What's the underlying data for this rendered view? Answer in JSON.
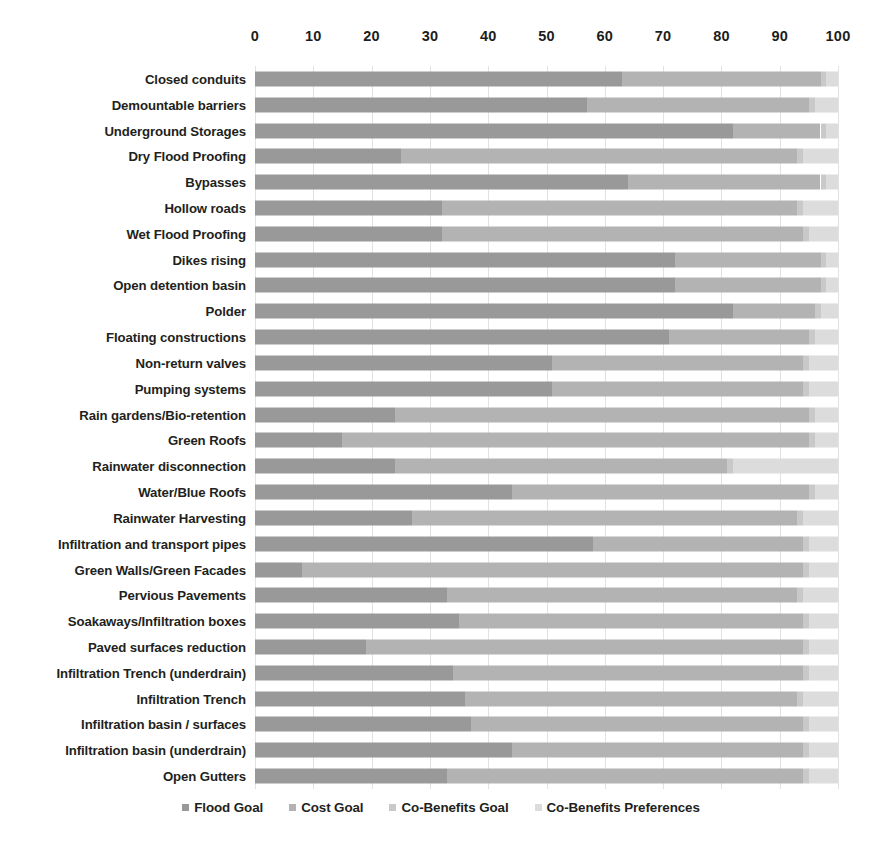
{
  "chart_data": {
    "type": "bar",
    "orientation": "horizontal",
    "stacked": true,
    "normalized_to_percent": true,
    "title": "",
    "xlabel": "",
    "ylabel": "",
    "xlim": [
      0,
      100
    ],
    "xticks": [
      0,
      10,
      20,
      30,
      40,
      50,
      60,
      70,
      80,
      90,
      100
    ],
    "grid": true,
    "grid_axis": "x",
    "legend_position": "bottom",
    "legend": [
      "Flood Goal",
      "Cost Goal",
      "Co-Benefits Goal",
      "Co-Benefits Preferences"
    ],
    "colors": [
      "#999999",
      "#b3b3b3",
      "#c9c9c9",
      "#dcdcdc"
    ],
    "categories": [
      "Closed conduits",
      "Demountable barriers",
      "Underground Storages",
      "Dry Flood Proofing",
      "Bypasses",
      "Hollow roads",
      "Wet Flood Proofing",
      "Dikes rising",
      "Open detention basin",
      "Polder",
      "Floating constructions",
      "Non-return valves",
      "Pumping systems",
      "Rain gardens/Bio-retention",
      "Green Roofs",
      "Rainwater disconnection",
      "Water/Blue Roofs",
      "Rainwater Harvesting",
      "Infiltration and transport pipes",
      "Green Walls/Green Facades",
      "Pervious Pavements",
      "Soakaways/Infiltration boxes",
      "Paved surfaces reduction",
      "Infiltration Trench (underdrain)",
      "Infiltration Trench",
      "Infiltration basin / surfaces",
      "Infiltration basin (underdrain)",
      "Open Gutters"
    ],
    "series": [
      {
        "name": "Flood Goal",
        "color": "#999999",
        "values": [
          63,
          57,
          82,
          25,
          64,
          32,
          32,
          72,
          72,
          82,
          71,
          51,
          51,
          24,
          15,
          24,
          44,
          27,
          58,
          8,
          33,
          35,
          19,
          34,
          36,
          37,
          44,
          33
        ]
      },
      {
        "name": "Cost Goal",
        "color": "#b3b3b3",
        "values": [
          34,
          38,
          15,
          68,
          33,
          61,
          62,
          25,
          25,
          14,
          24,
          43,
          43,
          71,
          80,
          57,
          51,
          66,
          36,
          86,
          60,
          59,
          75,
          60,
          57,
          57,
          50,
          61
        ]
      },
      {
        "name": "Co-Benefits Goal",
        "color": "#c9c9c9",
        "values": [
          1,
          1,
          1,
          1,
          1,
          1,
          1,
          1,
          1,
          1,
          1,
          1,
          1,
          1,
          1,
          1,
          1,
          1,
          1,
          1,
          1,
          1,
          1,
          1,
          1,
          1,
          1,
          1
        ]
      },
      {
        "name": "Co-Benefits Preferences",
        "color": "#dcdcdc",
        "values": [
          2,
          4,
          2,
          6,
          2,
          6,
          5,
          2,
          2,
          3,
          4,
          5,
          5,
          4,
          4,
          18,
          4,
          6,
          5,
          5,
          6,
          5,
          5,
          5,
          6,
          5,
          5,
          5
        ]
      }
    ]
  }
}
